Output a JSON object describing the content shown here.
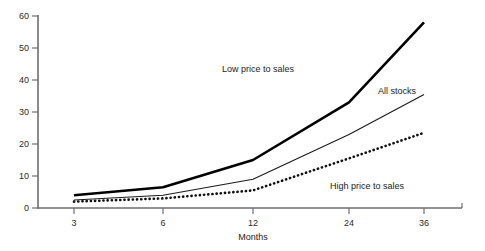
{
  "chart_data": {
    "type": "line",
    "title": "",
    "subtitle": "",
    "xlabel": "Months",
    "ylabel": "",
    "categories": [
      "3",
      "6",
      "12",
      "24",
      "36"
    ],
    "x_tick_labels": [
      "3",
      "6",
      "12",
      "24",
      "36"
    ],
    "y_tick_labels": [
      "0",
      "10",
      "20",
      "30",
      "40",
      "50",
      "60"
    ],
    "y_ticks": [
      0,
      10,
      20,
      30,
      40,
      50,
      60
    ],
    "xlim": [
      0,
      4
    ],
    "ylim": [
      0,
      60
    ],
    "grid": false,
    "legend_position": "inline-annotations",
    "series": [
      {
        "name": "Low price to sales",
        "style": "thick-solid",
        "color": "#000000",
        "values": [
          4,
          6.5,
          15,
          33,
          58
        ],
        "annotation": "Low price to sales"
      },
      {
        "name": "All stocks",
        "style": "thin-solid",
        "color": "#000000",
        "values": [
          2.5,
          4,
          9,
          23,
          35.5
        ],
        "annotation": "All stocks"
      },
      {
        "name": "High price to sales",
        "style": "dotted",
        "color": "#000000",
        "values": [
          2,
          3,
          5.5,
          15.5,
          23.5
        ],
        "annotation": "High price to sales"
      }
    ],
    "annotations": [
      {
        "text": "Low price to sales",
        "x": 222,
        "y": 72
      },
      {
        "text": "All stocks",
        "x": 378,
        "y": 94
      },
      {
        "text": "High price to sales",
        "x": 330,
        "y": 189
      }
    ]
  },
  "axes": {
    "x_axis_label": "Months",
    "y_tick_0": "0",
    "y_tick_10": "10",
    "y_tick_20": "20",
    "y_tick_30": "30",
    "y_tick_40": "40",
    "y_tick_50": "50",
    "y_tick_60": "60",
    "x_tick_3": "3",
    "x_tick_6": "6",
    "x_tick_12": "12",
    "x_tick_24": "24",
    "x_tick_36": "36"
  },
  "annotations": {
    "low_price_to_sales": "Low price to sales",
    "all_stocks": "All stocks",
    "high_price_to_sales": "High price to sales"
  }
}
